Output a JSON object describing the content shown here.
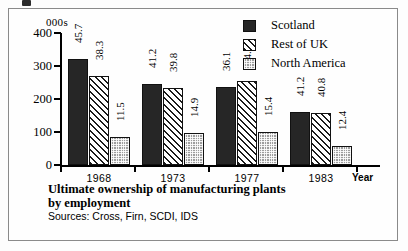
{
  "chart_data": {
    "type": "bar",
    "title": "Ultimate ownership of manufacturing plants by employment",
    "units_label": "000s",
    "xlabel": "Year",
    "ylabel": "",
    "ylim": [
      0,
      400
    ],
    "yticks": [
      0,
      100,
      200,
      300,
      400
    ],
    "grid": false,
    "legend_position": "top-right",
    "categories": [
      "1968",
      "1973",
      "1977",
      "1983"
    ],
    "series": [
      {
        "name": "Scotland",
        "values": [
          320,
          245,
          237,
          160
        ],
        "labels": [
          "45.7",
          "41.2",
          "36.1",
          "41.2"
        ],
        "color": "#262626",
        "pattern": "solid-dark"
      },
      {
        "name": "Rest of UK",
        "values": [
          270,
          233,
          255,
          158
        ],
        "labels": [
          "38.3",
          "39.8",
          "44.2",
          "40.8"
        ],
        "color": "#1b1b1b",
        "pattern": "diagonal-hatch"
      },
      {
        "name": "North America",
        "values": [
          86,
          98,
          100,
          57
        ],
        "labels": [
          "11.5",
          "14.9",
          "15.4",
          "12.4"
        ],
        "color": "#9d9d9d",
        "pattern": "checker-grey"
      }
    ],
    "annotation_note": "Bar-top numbers are percentage shares of total employment"
  },
  "caption": {
    "title_line1": "Ultimate ownership of manufacturing plants",
    "title_line2": "by employment",
    "sources": "Sources: Cross, Firn, SCDI, IDS"
  },
  "legend": {
    "items": [
      {
        "label": "Scotland"
      },
      {
        "label": "Rest of UK"
      },
      {
        "label": "North America"
      }
    ]
  },
  "axis": {
    "units": "000s",
    "year_caption": "Year",
    "y_ticks": [
      "400",
      "300",
      "200",
      "100",
      "0"
    ],
    "x_ticks": [
      "1968",
      "1973",
      "1977",
      "1983"
    ]
  }
}
